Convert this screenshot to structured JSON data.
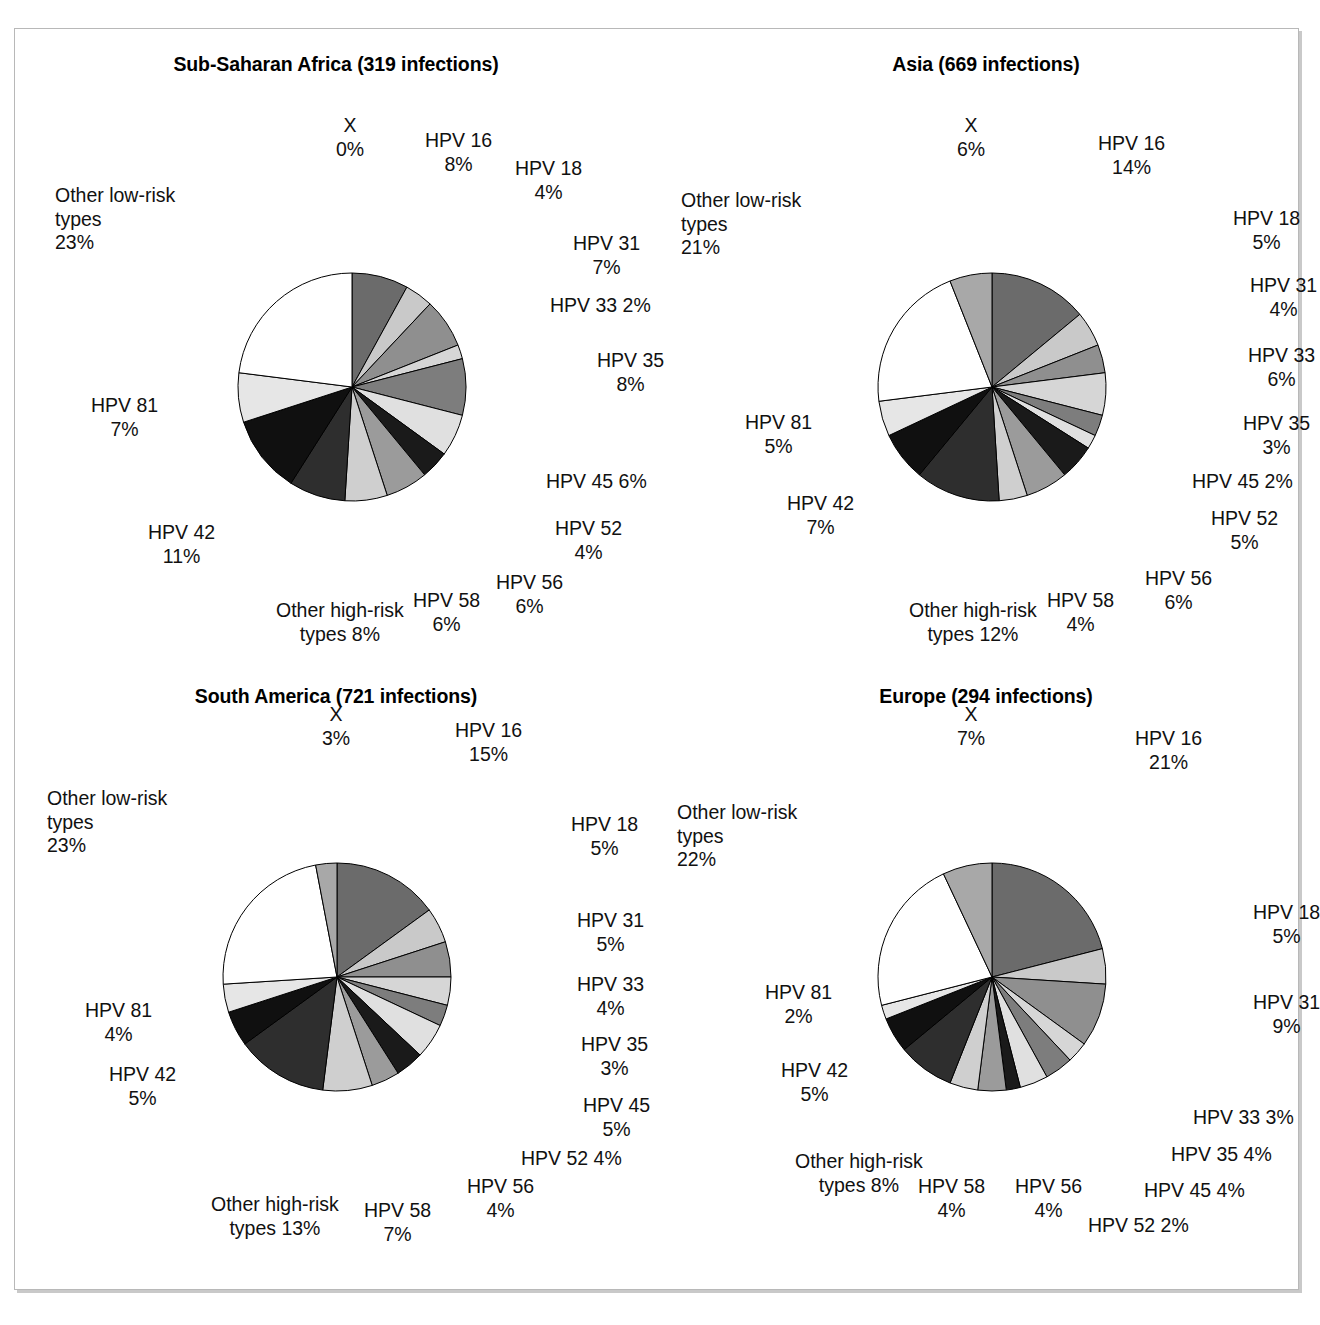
{
  "figure": {
    "panel_count": 4,
    "pie_radius": 114,
    "colors": {
      "HPV 16": "#6b6b6b",
      "HPV 18": "#c9c9c9",
      "HPV 31": "#8f8f8f",
      "HPV 33": "#d6d6d6",
      "HPV 35": "#7d7d7d",
      "HPV 45": "#e0e0e0",
      "HPV 52": "#1a1a1a",
      "HPV 56": "#9b9b9b",
      "HPV 58": "#cfcfcf",
      "Other high-risk types": "#2e2e2e",
      "HPV 42": "#101010",
      "HPV 81": "#e6e6e6",
      "Other low-risk types": "#ffffff",
      "X": "#a8a8a8",
      "outline": "#000000",
      "frame_border": "#b8b8b8",
      "frame_shadow": "#c9c9c9",
      "background": "#ffffff"
    }
  },
  "chart_data": [
    {
      "type": "pie",
      "title": "Sub-Saharan Africa (319 infections)",
      "region": "Sub-Saharan Africa",
      "infections": 319,
      "categories": [
        "HPV 16",
        "HPV 18",
        "HPV 31",
        "HPV 33",
        "HPV 35",
        "HPV 45",
        "HPV 52",
        "HPV 56",
        "HPV 58",
        "Other high-risk types",
        "HPV 42",
        "HPV 81",
        "Other low-risk types",
        "X"
      ],
      "values": [
        8,
        4,
        7,
        2,
        8,
        6,
        4,
        6,
        6,
        8,
        11,
        7,
        23,
        0
      ],
      "labels": [
        {
          "name": "X",
          "pct": "0%",
          "text": "X\n0%",
          "align": "c",
          "x": 321,
          "y": 85
        },
        {
          "name": "HPV 16",
          "pct": "8%",
          "text": "HPV 16\n8%",
          "align": "c",
          "x": 410,
          "y": 100
        },
        {
          "name": "HPV 18",
          "pct": "4%",
          "text": "HPV 18\n4%",
          "align": "c",
          "x": 500,
          "y": 128
        },
        {
          "name": "HPV 31",
          "pct": "7%",
          "text": "HPV 31\n7%",
          "align": "c",
          "x": 558,
          "y": 203
        },
        {
          "name": "HPV 33",
          "pct": "2%",
          "text": "HPV 33 2%",
          "align": "l",
          "x": 535,
          "y": 265
        },
        {
          "name": "HPV 35",
          "pct": "8%",
          "text": "HPV 35\n8%",
          "align": "c",
          "x": 582,
          "y": 320
        },
        {
          "name": "HPV 45",
          "pct": "6%",
          "text": "HPV 45 6%",
          "align": "l",
          "x": 531,
          "y": 441
        },
        {
          "name": "HPV 52",
          "pct": "4%",
          "text": "HPV 52\n4%",
          "align": "c",
          "x": 540,
          "y": 488
        },
        {
          "name": "HPV 56",
          "pct": "6%",
          "text": "HPV 56\n6%",
          "align": "c",
          "x": 481,
          "y": 542
        },
        {
          "name": "HPV 58",
          "pct": "6%",
          "text": "HPV 58\n6%",
          "align": "c",
          "x": 398,
          "y": 560
        },
        {
          "name": "Other high-risk types",
          "pct": "8%",
          "text": "Other high-risk\ntypes 8%",
          "align": "c",
          "x": 261,
          "y": 570
        },
        {
          "name": "HPV 42",
          "pct": "11%",
          "text": "HPV 42\n11%",
          "align": "c",
          "x": 133,
          "y": 492
        },
        {
          "name": "HPV 81",
          "pct": "7%",
          "text": "HPV 81\n7%",
          "align": "c",
          "x": 76,
          "y": 365
        },
        {
          "name": "Other low-risk types",
          "pct": "23%",
          "text": "Other low-risk\ntypes\n23%",
          "align": "l",
          "x": 40,
          "y": 155
        }
      ]
    },
    {
      "type": "pie",
      "title": "Asia (669 infections)",
      "region": "Asia",
      "infections": 669,
      "categories": [
        "HPV 16",
        "HPV 18",
        "HPV 31",
        "HPV 33",
        "HPV 35",
        "HPV 45",
        "HPV 52",
        "HPV 56",
        "HPV 58",
        "Other high-risk types",
        "HPV 42",
        "HPV 81",
        "Other low-risk types",
        "X"
      ],
      "values": [
        14,
        5,
        4,
        6,
        3,
        2,
        5,
        6,
        4,
        12,
        7,
        5,
        21,
        6
      ],
      "labels": [
        {
          "name": "X",
          "pct": "6%",
          "text": "X\n6%",
          "align": "c",
          "x": 292,
          "y": 85
        },
        {
          "name": "HPV 16",
          "pct": "14%",
          "text": "HPV 16\n14%",
          "align": "c",
          "x": 433,
          "y": 103
        },
        {
          "name": "HPV 18",
          "pct": "5%",
          "text": "HPV 18\n5%",
          "align": "c",
          "x": 568,
          "y": 178
        },
        {
          "name": "HPV 31",
          "pct": "4%",
          "text": "HPV 31\n4%",
          "align": "c",
          "x": 585,
          "y": 245
        },
        {
          "name": "HPV 33",
          "pct": "6%",
          "text": "HPV 33\n6%",
          "align": "c",
          "x": 583,
          "y": 315
        },
        {
          "name": "HPV 35",
          "pct": "3%",
          "text": "HPV 35\n3%",
          "align": "c",
          "x": 578,
          "y": 383
        },
        {
          "name": "HPV 45",
          "pct": "2%",
          "text": "HPV 45 2%",
          "align": "l",
          "x": 527,
          "y": 441
        },
        {
          "name": "HPV 52",
          "pct": "5%",
          "text": "HPV 52\n5%",
          "align": "c",
          "x": 546,
          "y": 478
        },
        {
          "name": "HPV 56",
          "pct": "6%",
          "text": "HPV 56\n6%",
          "align": "c",
          "x": 480,
          "y": 538
        },
        {
          "name": "HPV 58",
          "pct": "4%",
          "text": "HPV 58\n4%",
          "align": "c",
          "x": 382,
          "y": 560
        },
        {
          "name": "Other high-risk types",
          "pct": "12%",
          "text": "Other high-risk\ntypes 12%",
          "align": "c",
          "x": 244,
          "y": 570
        },
        {
          "name": "HPV 42",
          "pct": "7%",
          "text": "HPV 42\n7%",
          "align": "c",
          "x": 122,
          "y": 463
        },
        {
          "name": "HPV 81",
          "pct": "5%",
          "text": "HPV 81\n5%",
          "align": "c",
          "x": 80,
          "y": 382
        },
        {
          "name": "Other low-risk types",
          "pct": "21%",
          "text": "Other low-risk\ntypes\n21%",
          "align": "l",
          "x": 16,
          "y": 160
        }
      ]
    },
    {
      "type": "pie",
      "title": "South America (721 infections)",
      "region": "South America",
      "infections": 721,
      "categories": [
        "HPV 16",
        "HPV 18",
        "HPV 31",
        "HPV 33",
        "HPV 35",
        "HPV 45",
        "HPV 52",
        "HPV 56",
        "HPV 58",
        "Other high-risk types",
        "HPV 42",
        "HPV 81",
        "Other low-risk types",
        "X"
      ],
      "values": [
        15,
        5,
        5,
        4,
        3,
        5,
        4,
        4,
        7,
        13,
        5,
        4,
        23,
        3
      ],
      "labels": [
        {
          "name": "X",
          "pct": "3%",
          "text": "X\n3%",
          "align": "c",
          "x": 307,
          "y": 42
        },
        {
          "name": "HPV 16",
          "pct": "15%",
          "text": "HPV 16\n15%",
          "align": "c",
          "x": 440,
          "y": 58
        },
        {
          "name": "HPV 18",
          "pct": "5%",
          "text": "HPV 18\n5%",
          "align": "c",
          "x": 556,
          "y": 152
        },
        {
          "name": "HPV 31",
          "pct": "5%",
          "text": "HPV 31\n5%",
          "align": "c",
          "x": 562,
          "y": 248
        },
        {
          "name": "HPV 33",
          "pct": "4%",
          "text": "HPV 33\n4%",
          "align": "c",
          "x": 562,
          "y": 312
        },
        {
          "name": "HPV 35",
          "pct": "3%",
          "text": "HPV 35\n3%",
          "align": "c",
          "x": 566,
          "y": 372
        },
        {
          "name": "HPV 45",
          "pct": "5%",
          "text": "HPV 45\n5%",
          "align": "c",
          "x": 568,
          "y": 433
        },
        {
          "name": "HPV 52",
          "pct": "4%",
          "text": "HPV 52 4%",
          "align": "l",
          "x": 506,
          "y": 486
        },
        {
          "name": "HPV 56",
          "pct": "4%",
          "text": "HPV 56\n4%",
          "align": "c",
          "x": 452,
          "y": 514
        },
        {
          "name": "HPV 58",
          "pct": "7%",
          "text": "HPV 58\n7%",
          "align": "c",
          "x": 349,
          "y": 538
        },
        {
          "name": "Other high-risk types",
          "pct": "13%",
          "text": "Other high-risk\ntypes 13%",
          "align": "c",
          "x": 196,
          "y": 532
        },
        {
          "name": "HPV 42",
          "pct": "5%",
          "text": "HPV 42\n5%",
          "align": "c",
          "x": 94,
          "y": 402
        },
        {
          "name": "HPV 81",
          "pct": "4%",
          "text": "HPV 81\n4%",
          "align": "c",
          "x": 70,
          "y": 338
        },
        {
          "name": "Other low-risk types",
          "pct": "23%",
          "text": "Other low-risk\ntypes\n23%",
          "align": "l",
          "x": 32,
          "y": 126
        }
      ]
    },
    {
      "type": "pie",
      "title": "Europe (294 infections)",
      "region": "Europe",
      "infections": 294,
      "categories": [
        "HPV 16",
        "HPV 18",
        "HPV 31",
        "HPV 33",
        "HPV 35",
        "HPV 45",
        "HPV 52",
        "HPV 56",
        "HPV 58",
        "Other high-risk types",
        "HPV 42",
        "HPV 81",
        "Other low-risk types",
        "X"
      ],
      "values": [
        21,
        5,
        9,
        3,
        4,
        4,
        2,
        4,
        4,
        8,
        5,
        2,
        22,
        7
      ],
      "labels": [
        {
          "name": "X",
          "pct": "7%",
          "text": "X\n7%",
          "align": "c",
          "x": 292,
          "y": 42
        },
        {
          "name": "HPV 16",
          "pct": "21%",
          "text": "HPV 16\n21%",
          "align": "c",
          "x": 470,
          "y": 66
        },
        {
          "name": "HPV 18",
          "pct": "5%",
          "text": "HPV 18\n5%",
          "align": "c",
          "x": 588,
          "y": 240
        },
        {
          "name": "HPV 31",
          "pct": "9%",
          "text": "HPV 31\n9%",
          "align": "c",
          "x": 588,
          "y": 330
        },
        {
          "name": "HPV 33",
          "pct": "3%",
          "text": "HPV 33 3%",
          "align": "l",
          "x": 528,
          "y": 445
        },
        {
          "name": "HPV 35",
          "pct": "4%",
          "text": "HPV 35 4%",
          "align": "l",
          "x": 506,
          "y": 482
        },
        {
          "name": "HPV 45",
          "pct": "4%",
          "text": "HPV 45 4%",
          "align": "l",
          "x": 479,
          "y": 518
        },
        {
          "name": "HPV 52",
          "pct": "2%",
          "text": "HPV 52 2%",
          "align": "l",
          "x": 423,
          "y": 553
        },
        {
          "name": "HPV 56",
          "pct": "4%",
          "text": "HPV 56\n4%",
          "align": "c",
          "x": 350,
          "y": 514
        },
        {
          "name": "HPV 58",
          "pct": "4%",
          "text": "HPV 58\n4%",
          "align": "c",
          "x": 253,
          "y": 514
        },
        {
          "name": "Other high-risk types",
          "pct": "8%",
          "text": "Other high-risk\ntypes 8%",
          "align": "c",
          "x": 130,
          "y": 489
        },
        {
          "name": "HPV 42",
          "pct": "5%",
          "text": "HPV 42\n5%",
          "align": "c",
          "x": 116,
          "y": 398
        },
        {
          "name": "HPV 81",
          "pct": "2%",
          "text": "HPV 81\n2%",
          "align": "c",
          "x": 100,
          "y": 320
        },
        {
          "name": "Other low-risk types",
          "pct": "22%",
          "text": "Other low-risk\ntypes\n22%",
          "align": "l",
          "x": 12,
          "y": 140
        }
      ]
    }
  ]
}
